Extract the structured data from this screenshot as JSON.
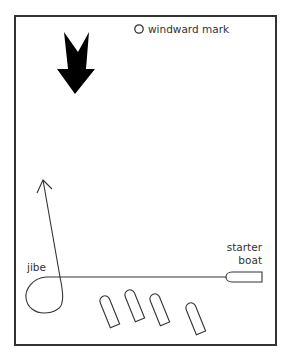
{
  "diagram": {
    "type": "sailing-race-start-diagram",
    "colors": {
      "line": "#333333",
      "fill": "#000000",
      "background": "#ffffff"
    },
    "wind_arrow": {
      "icon": "wind-direction-arrow",
      "direction": "down"
    },
    "windward_mark": {
      "icon": "circle-mark-icon",
      "label": "windward mark"
    },
    "course_path": {
      "icon": "course-path-arrow",
      "direction": "up"
    },
    "jibe": {
      "label": "jibe"
    },
    "starter_boat": {
      "label_line1": "starter",
      "label_line2": "boat"
    },
    "boats": [
      {
        "id": 1,
        "cx": 109,
        "cy": 311,
        "angle": -22
      },
      {
        "id": 2,
        "cx": 134,
        "cy": 305,
        "angle": -22
      },
      {
        "id": 3,
        "cx": 159,
        "cy": 309,
        "angle": -22
      },
      {
        "id": 4,
        "cx": 195,
        "cy": 318,
        "angle": -22
      }
    ]
  }
}
